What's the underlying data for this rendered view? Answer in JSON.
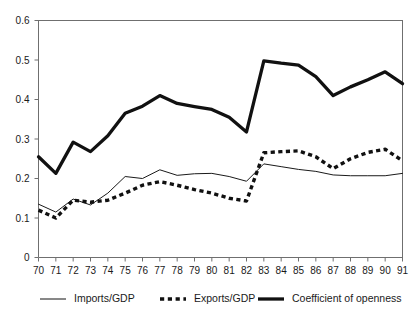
{
  "chart_data": {
    "type": "line",
    "title": "",
    "subtitle": "",
    "xlabel": "",
    "ylabel": "",
    "grid": false,
    "legend_position": "bottom",
    "xlim": [
      70,
      91
    ],
    "ylim": [
      0,
      0.6
    ],
    "ytick_labels": [
      "0.6",
      "0.5",
      "0.4",
      "0.3",
      "0.2",
      "0.1",
      "0"
    ],
    "ytick_values": [
      0.6,
      0.5,
      0.4,
      0.3,
      0.2,
      0.1,
      0
    ],
    "xtick_labels": [
      "70",
      "71",
      "72",
      "73",
      "74",
      "75",
      "76",
      "77",
      "78",
      "79",
      "80",
      "81",
      "82",
      "83",
      "84",
      "85",
      "86",
      "87",
      "88",
      "89",
      "90",
      "91"
    ],
    "x": [
      70,
      71,
      72,
      73,
      74,
      75,
      76,
      77,
      78,
      79,
      80,
      81,
      82,
      83,
      84,
      85,
      86,
      87,
      88,
      89,
      90,
      91
    ],
    "series": [
      {
        "name": "Imports/GDP",
        "style": "thin-solid",
        "color": "#1a1a1a",
        "values": [
          0.135,
          0.115,
          0.148,
          0.133,
          0.163,
          0.205,
          0.2,
          0.222,
          0.208,
          0.212,
          0.213,
          0.205,
          0.193,
          0.237,
          0.23,
          0.223,
          0.218,
          0.209,
          0.207,
          0.207,
          0.207,
          0.213
        ]
      },
      {
        "name": "Exports/GDP",
        "style": "bold-dashed",
        "color": "#111111",
        "values": [
          0.12,
          0.1,
          0.145,
          0.14,
          0.145,
          0.163,
          0.183,
          0.192,
          0.183,
          0.172,
          0.163,
          0.15,
          0.143,
          0.265,
          0.268,
          0.27,
          0.255,
          0.225,
          0.25,
          0.266,
          0.274,
          0.245
        ]
      },
      {
        "name": "Coefficient of openness",
        "style": "thick-solid",
        "color": "#111111",
        "values": [
          0.255,
          0.213,
          0.292,
          0.268,
          0.308,
          0.365,
          0.383,
          0.41,
          0.39,
          0.382,
          0.375,
          0.355,
          0.318,
          0.498,
          0.492,
          0.487,
          0.458,
          0.41,
          0.432,
          0.45,
          0.47,
          0.44
        ]
      }
    ],
    "legend": [
      {
        "label": "Imports/GDP",
        "style": "thin-solid"
      },
      {
        "label": "Exports/GDP",
        "style": "bold-dashed"
      },
      {
        "label": "Coefficient of openness",
        "style": "thick-solid"
      }
    ]
  }
}
